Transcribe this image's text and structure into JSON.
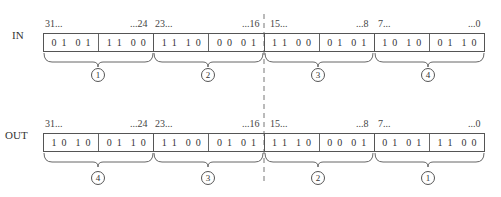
{
  "rows": [
    {
      "label": "IN",
      "indices": [
        "31...",
        "...24",
        "23...",
        "...16",
        "15...",
        "...8",
        "7...",
        "...0"
      ],
      "bytes": [
        {
          "nibbles": [
            "0101",
            "1100"
          ],
          "group": "1"
        },
        {
          "nibbles": [
            "1110",
            "0001"
          ],
          "group": "2"
        },
        {
          "nibbles": [
            "1100",
            "0101"
          ],
          "group": "3"
        },
        {
          "nibbles": [
            "1010",
            "0110"
          ],
          "group": "4"
        }
      ]
    },
    {
      "label": "OUT",
      "indices": [
        "31...",
        "...24",
        "23...",
        "...16",
        "15...",
        "...8",
        "7...",
        "...0"
      ],
      "bytes": [
        {
          "nibbles": [
            "1010",
            "0110"
          ],
          "group": "4"
        },
        {
          "nibbles": [
            "1100",
            "0101"
          ],
          "group": "3"
        },
        {
          "nibbles": [
            "1110",
            "0001"
          ],
          "group": "2"
        },
        {
          "nibbles": [
            "0101",
            "1100"
          ],
          "group": "1"
        }
      ]
    }
  ],
  "colors": {
    "line": "#555555",
    "text": "#333333",
    "background": "#ffffff"
  }
}
